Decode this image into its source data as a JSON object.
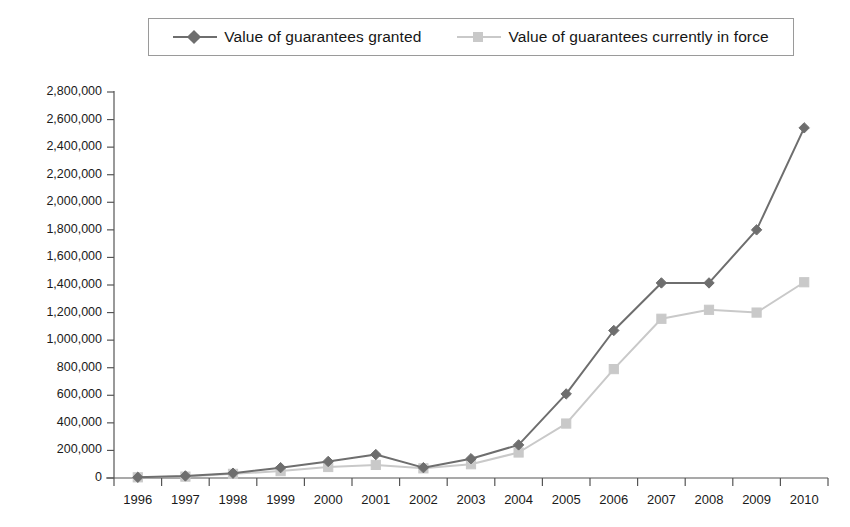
{
  "legend": {
    "position": "top-center",
    "entries": [
      {
        "label": "Value of guarantees granted",
        "color": "#6e6e6e",
        "marker": "diamond"
      },
      {
        "label": "Value of guarantees currently in force",
        "color": "#c9c9c9",
        "marker": "square"
      }
    ]
  },
  "chart_data": {
    "type": "line",
    "title": "",
    "subtitle": "",
    "xlabel": "",
    "ylabel": "",
    "grid": false,
    "legend_position": "top-center",
    "categories": [
      "1996",
      "1997",
      "1998",
      "1999",
      "2000",
      "2001",
      "2002",
      "2003",
      "2004",
      "2005",
      "2006",
      "2007",
      "2008",
      "2009",
      "2010"
    ],
    "ylim": [
      0,
      2800000
    ],
    "ytick_step": 200000,
    "ytick_labels": [
      "0",
      "200,000",
      "400,000",
      "600,000",
      "800,000",
      "1,000,000",
      "1,200,000",
      "1,400,000",
      "1,600,000",
      "1,800,000",
      "2,000,000",
      "2,200,000",
      "2,400,000",
      "2,600,000",
      "2,800,000"
    ],
    "ytick_values": [
      0,
      200000,
      400000,
      600000,
      800000,
      1000000,
      1200000,
      1400000,
      1600000,
      1800000,
      2000000,
      2200000,
      2400000,
      2600000,
      2800000
    ],
    "series": [
      {
        "name": "Value of guarantees granted",
        "color": "#6e6e6e",
        "marker": "diamond",
        "values": [
          5000,
          15000,
          35000,
          75000,
          120000,
          170000,
          75000,
          140000,
          240000,
          610000,
          1070000,
          1415000,
          1415000,
          1800000,
          2540000
        ]
      },
      {
        "name": "Value of guarantees currently in force",
        "color": "#c9c9c9",
        "marker": "square",
        "values": [
          5000,
          10000,
          30000,
          50000,
          80000,
          95000,
          70000,
          100000,
          185000,
          395000,
          790000,
          1155000,
          1220000,
          1200000,
          1420000
        ]
      }
    ]
  }
}
